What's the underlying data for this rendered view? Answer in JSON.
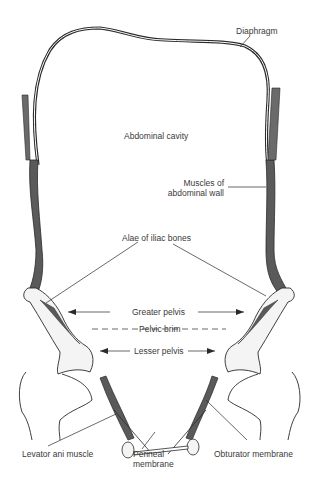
{
  "diagram": {
    "type": "anatomical-illustration",
    "labels": {
      "diaphragm": "Diaphragm",
      "abdominal_cavity": "Abdominal cavity",
      "muscles_line1": "Muscles of",
      "muscles_line2": "abdominal wall",
      "alae": "Alae of iliac bones",
      "greater_pelvis": "Greater pelvis",
      "pelvic_brim": "Pelvic brim",
      "lesser_pelvis": "Lesser pelvis",
      "levator_ani": "Levator ani muscle",
      "perineal_line1": "Perineal",
      "perineal_line2": "membrane",
      "obturator": "Obturator membrane"
    },
    "colors": {
      "line": "#2a2a2a",
      "muscle_fill": "#5a5a5a",
      "bone_fill": "#f4f4f4",
      "text": "#3a3a3a",
      "background": "#ffffff"
    }
  }
}
